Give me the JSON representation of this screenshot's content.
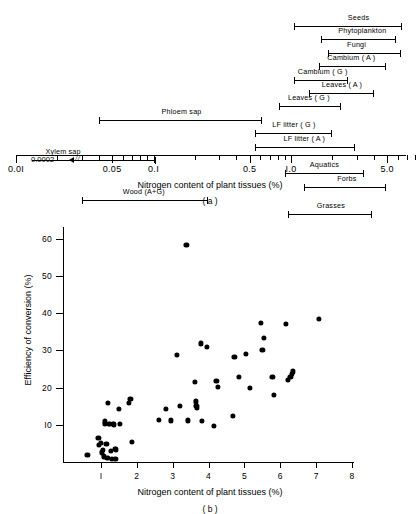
{
  "figure": {
    "panel_a": {
      "caption": "( a )",
      "xlabel": "Nitrogen content of plant tissues (%)",
      "axis_type": "log",
      "axis_min": 0.01,
      "axis_max": 8.0,
      "tick_major_labels": [
        "0.0I",
        "0.05",
        "0.I",
        "0.5",
        "I.0",
        "5.0"
      ],
      "tick_major_values": [
        0.01,
        0.05,
        0.1,
        0.5,
        1.0,
        5.0
      ],
      "tick_minor_values": [
        0.02,
        0.03,
        0.04,
        0.06,
        0.07,
        0.08,
        0.09,
        0.2,
        0.3,
        0.4,
        0.6,
        0.7,
        0.8,
        0.9,
        2.0,
        3.0,
        4.0,
        6.0,
        7.0,
        8.0
      ],
      "off_scale_note": "0.0002",
      "break_mark": "//",
      "ranges": [
        {
          "label": "Seeds",
          "min": 1.05,
          "max": 6.4,
          "label_pos": 3.1,
          "open_left": false
        },
        {
          "label": "Phytoplankton",
          "min": 1.65,
          "max": 5.8,
          "label_pos": 3.3,
          "open_left": false
        },
        {
          "label": "Fungi",
          "min": 1.85,
          "max": 6.3,
          "label_pos": 3.0,
          "open_left": false
        },
        {
          "label": "Cambium ( A )",
          "min": 1.6,
          "max": 4.9,
          "label_pos": 2.75,
          "open_left": false
        },
        {
          "label": "Cambium ( G )",
          "min": 1.05,
          "max": 2.6,
          "label_pos": 1.7,
          "open_left": false
        },
        {
          "label": "Leaves ( A )",
          "min": 1.35,
          "max": 4.0,
          "label_pos": 2.35,
          "open_left": false
        },
        {
          "label": "Leaves ( G )",
          "min": 0.82,
          "max": 2.3,
          "label_pos": 1.35,
          "open_left": false
        },
        {
          "label": "Phloem sap",
          "min": 0.04,
          "max": 0.62,
          "label_pos": 0.16,
          "open_left": false
        },
        {
          "label": "LF litter ( G )",
          "min": 0.55,
          "max": 2.0,
          "label_pos": 1.05,
          "open_left": false
        },
        {
          "label": "LF litter ( A )",
          "min": 0.55,
          "max": 2.9,
          "label_pos": 1.25,
          "open_left": false
        },
        {
          "label": "Xylem sap",
          "min": 0.0002,
          "max": 0.105,
          "label_pos": 0.022,
          "open_left": true
        },
        {
          "label": "Aquatics",
          "min": 0.9,
          "max": 3.4,
          "label_pos": 1.75,
          "open_left": false
        },
        {
          "label": "Forbs",
          "min": 1.25,
          "max": 4.9,
          "label_pos": 2.55,
          "open_left": false
        },
        {
          "label": "Wood (A+G)",
          "min": 0.03,
          "max": 0.25,
          "label_pos": 0.085,
          "open_left": false
        },
        {
          "label": "Grasses",
          "min": 0.95,
          "max": 3.9,
          "label_pos": 1.95,
          "open_left": false
        }
      ]
    },
    "panel_b": {
      "caption": "( b )",
      "chart_title": "",
      "xlabel": "Nitrogen content of plant tissues (%)",
      "ylabel": "Efficiency of conversion (%)",
      "xticks": [
        "I",
        "2",
        "3",
        "4",
        "5",
        "6",
        "7",
        "8"
      ],
      "xtick_values": [
        1,
        2,
        3,
        4,
        5,
        6,
        7,
        8
      ],
      "yticks": [
        "I0",
        "20",
        "30",
        "40",
        "50",
        "60"
      ],
      "ytick_values": [
        10,
        20,
        30,
        40,
        50,
        60
      ],
      "xlim": [
        0.3,
        8.0
      ],
      "ylim": [
        0,
        62
      ]
    }
  },
  "chart_data": [
    {
      "type": "bar",
      "orientation": "horizontal-range",
      "title": "(a) Nitrogen content ranges of plant tissues",
      "xlabel": "Nitrogen content of plant tissues (%)",
      "ylabel": "",
      "xscale": "log",
      "xlim": [
        0.01,
        8.0
      ],
      "grid": false,
      "legend": "none",
      "categories": [
        "Seeds",
        "Phytoplankton",
        "Fungi",
        "Cambium ( A )",
        "Cambium ( G )",
        "Leaves ( A )",
        "Leaves ( G )",
        "Phloem sap",
        "LF litter ( G )",
        "LF litter ( A )",
        "Xylem sap",
        "Aquatics",
        "Forbs",
        "Wood (A+G)",
        "Grasses"
      ],
      "ranges_min": [
        1.05,
        1.65,
        1.85,
        1.6,
        1.05,
        1.35,
        0.82,
        0.04,
        0.55,
        0.55,
        0.0002,
        0.9,
        1.25,
        0.03,
        0.95
      ],
      "ranges_max": [
        6.4,
        5.8,
        6.3,
        4.9,
        2.6,
        4.0,
        2.3,
        0.62,
        2.0,
        2.9,
        0.105,
        3.4,
        4.9,
        0.25,
        3.9
      ],
      "annotations": [
        "0.0002 (Xylem sap lower limit, off scale)"
      ]
    },
    {
      "type": "scatter",
      "title": "(b) Efficiency of conversion vs nitrogen content",
      "xlabel": "Nitrogen content of plant tissues (%)",
      "ylabel": "Efficiency of conversion (%)",
      "xlim": [
        0.3,
        8.0
      ],
      "ylim": [
        0,
        62
      ],
      "grid": false,
      "legend": "none",
      "points": [
        [
          0.62,
          1.8
        ],
        [
          0.93,
          6.4
        ],
        [
          0.95,
          4.6
        ],
        [
          1.0,
          5.2
        ],
        [
          1.02,
          2.6
        ],
        [
          1.05,
          3.3
        ],
        [
          1.08,
          1.5
        ],
        [
          1.1,
          10.4
        ],
        [
          1.12,
          11.0
        ],
        [
          1.15,
          4.8
        ],
        [
          1.18,
          1.2
        ],
        [
          1.2,
          16.0
        ],
        [
          1.22,
          10.2
        ],
        [
          1.25,
          10.3
        ],
        [
          1.28,
          3.0
        ],
        [
          1.3,
          0.9
        ],
        [
          1.33,
          10.2
        ],
        [
          1.36,
          10.1
        ],
        [
          1.38,
          3.5
        ],
        [
          1.4,
          0.8
        ],
        [
          1.42,
          3.4
        ],
        [
          1.5,
          14.3
        ],
        [
          1.52,
          10.3
        ],
        [
          1.78,
          15.9
        ],
        [
          1.82,
          16.9
        ],
        [
          1.86,
          5.3
        ],
        [
          2.62,
          11.3
        ],
        [
          2.82,
          14.3
        ],
        [
          2.95,
          11.2
        ],
        [
          3.12,
          28.9
        ],
        [
          3.2,
          15.0
        ],
        [
          3.38,
          58.5
        ],
        [
          3.42,
          11.2
        ],
        [
          3.62,
          21.5
        ],
        [
          3.65,
          16.3
        ],
        [
          3.66,
          15.2
        ],
        [
          3.68,
          14.6
        ],
        [
          3.78,
          31.9
        ],
        [
          3.82,
          11.1
        ],
        [
          3.95,
          31.0
        ],
        [
          4.15,
          9.8
        ],
        [
          4.22,
          21.8
        ],
        [
          4.25,
          20.3
        ],
        [
          4.68,
          12.4
        ],
        [
          4.72,
          28.2
        ],
        [
          4.85,
          22.8
        ],
        [
          5.05,
          29.0
        ],
        [
          5.15,
          20.0
        ],
        [
          5.45,
          37.4
        ],
        [
          5.5,
          30.2
        ],
        [
          5.55,
          33.4
        ],
        [
          5.78,
          22.9
        ],
        [
          5.82,
          18.1
        ],
        [
          6.15,
          37.2
        ],
        [
          6.22,
          22.0
        ],
        [
          6.28,
          22.8
        ],
        [
          6.32,
          23.6
        ],
        [
          6.36,
          24.4
        ],
        [
          7.08,
          38.4
        ]
      ]
    }
  ]
}
